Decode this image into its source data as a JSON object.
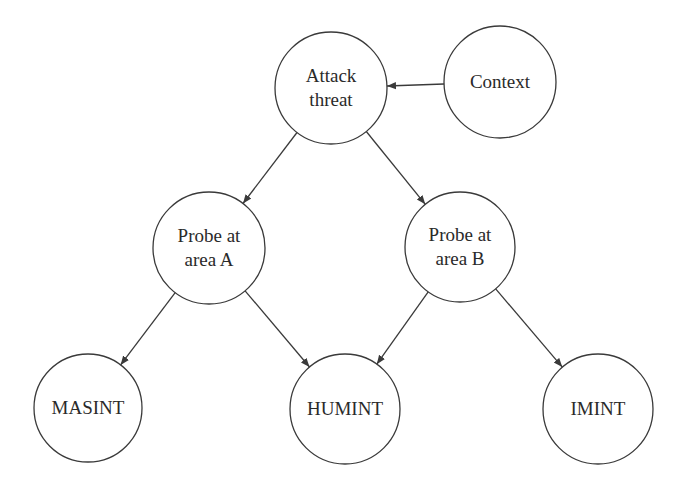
{
  "diagram": {
    "type": "directed-graph",
    "nodes": [
      {
        "id": "attack",
        "lines": [
          "Attack",
          "threat"
        ],
        "cx": 331,
        "cy": 88,
        "r": 56
      },
      {
        "id": "context",
        "lines": [
          "Context"
        ],
        "cx": 500,
        "cy": 82,
        "r": 56
      },
      {
        "id": "probeA",
        "lines": [
          "Probe at",
          "area A"
        ],
        "cx": 209,
        "cy": 248,
        "r": 56
      },
      {
        "id": "probeB",
        "lines": [
          "Probe at",
          "area B"
        ],
        "cx": 460,
        "cy": 247,
        "r": 55
      },
      {
        "id": "masint",
        "lines": [
          "MASINT"
        ],
        "cx": 88,
        "cy": 408,
        "r": 54
      },
      {
        "id": "humint",
        "lines": [
          "HUMINT"
        ],
        "cx": 345,
        "cy": 409,
        "r": 55
      },
      {
        "id": "imint",
        "lines": [
          "IMINT"
        ],
        "cx": 598,
        "cy": 409,
        "r": 55
      }
    ],
    "edges": [
      {
        "from": "context",
        "to": "attack"
      },
      {
        "from": "attack",
        "to": "probeA"
      },
      {
        "from": "attack",
        "to": "probeB"
      },
      {
        "from": "probeA",
        "to": "masint"
      },
      {
        "from": "probeA",
        "to": "humint"
      },
      {
        "from": "probeB",
        "to": "humint"
      },
      {
        "from": "probeB",
        "to": "imint"
      }
    ],
    "colors": {
      "stroke": "#3a3a3a",
      "text": "#2a2a2a",
      "background": "#ffffff"
    }
  }
}
